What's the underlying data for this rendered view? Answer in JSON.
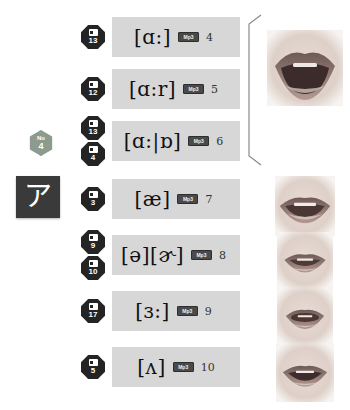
{
  "page": {
    "background_color": "#ffffff",
    "panel_color": "#d7d7d7",
    "badge_color": "#242424",
    "hex_badge_color": "#8d9b8f",
    "kana_tile_color": "#3a3a3a"
  },
  "left": {
    "hex_badge": {
      "top_label": "No",
      "number": "4",
      "icon": "hexagon-badge-icon"
    },
    "kana_tile": {
      "character": "ア",
      "icon": "katakana-a-tile"
    }
  },
  "group_bracket": {
    "icon": "group-bracket-icon",
    "spans_rows": 3
  },
  "rows": [
    {
      "badges": [
        {
          "number": "13",
          "icon": "video-badge-icon"
        }
      ],
      "symbol": "[ɑ:]",
      "audio_label": "Mp3",
      "item_number": "4",
      "mouth": "mouth-wide-open-photo",
      "has_mouth": true
    },
    {
      "badges": [
        {
          "number": "12",
          "icon": "video-badge-icon"
        }
      ],
      "symbol": "[ɑ:r]",
      "audio_label": "Mp3",
      "item_number": "5",
      "mouth": "",
      "has_mouth": false
    },
    {
      "badges": [
        {
          "number": "13",
          "icon": "video-badge-icon"
        },
        {
          "number": "4",
          "icon": "video-badge-icon"
        }
      ],
      "symbol": "[ɑ:|ɒ]",
      "audio_label": "Mp3",
      "item_number": "6",
      "mouth": "",
      "has_mouth": false
    },
    {
      "badges": [
        {
          "number": "3",
          "icon": "video-badge-icon"
        }
      ],
      "symbol": "[æ]",
      "audio_label": "Mp3",
      "item_number": "7",
      "mouth": "mouth-spread-open-photo",
      "has_mouth": true
    },
    {
      "badges": [
        {
          "number": "9",
          "icon": "video-badge-icon"
        },
        {
          "number": "10",
          "icon": "video-badge-icon"
        }
      ],
      "symbol": "[ə][ɚ]",
      "audio_label": "Mp3",
      "item_number": "8",
      "mouth": "mouth-relaxed-photo",
      "has_mouth": true
    },
    {
      "badges": [
        {
          "number": "17",
          "icon": "video-badge-icon"
        }
      ],
      "symbol": "[ɜ:]",
      "audio_label": "Mp3",
      "item_number": "9",
      "mouth": "mouth-rounded-photo",
      "has_mouth": true
    },
    {
      "badges": [
        {
          "number": "5",
          "icon": "video-badge-icon"
        }
      ],
      "symbol": "[ʌ]",
      "audio_label": "Mp3",
      "item_number": "10",
      "mouth": "mouth-slightly-open-photo",
      "has_mouth": true
    }
  ]
}
